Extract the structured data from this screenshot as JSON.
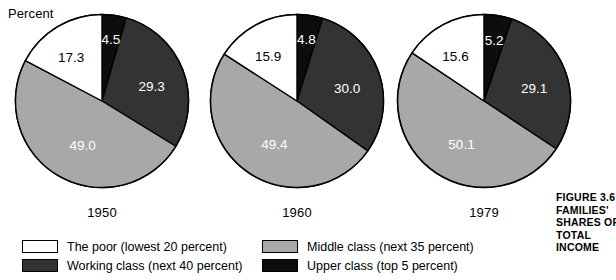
{
  "axis": {
    "unit_label": "Percent"
  },
  "caption": {
    "lines": [
      "FIGURE 3.6",
      "FAMILIES'",
      "SHARES OF",
      "TOTAL",
      "INCOME"
    ]
  },
  "legend": {
    "columns": [
      {
        "items": [
          {
            "label": "The poor (lowest 20 percent)",
            "color": "#ffffff",
            "swatch_name": "legend-swatch-the-poor"
          },
          {
            "label": "Working class (next 40 percent)",
            "color": "#333333",
            "swatch_name": "legend-swatch-working-class"
          }
        ]
      },
      {
        "items": [
          {
            "label": "Middle class (next 35 percent)",
            "color": "#a8a8a8",
            "swatch_name": "legend-swatch-middle-class"
          },
          {
            "label": "Upper class (top 5 percent)",
            "color": "#0d0d0d",
            "swatch_name": "legend-swatch-upper-class"
          }
        ]
      }
    ]
  },
  "colors": {
    "the_poor": "#ffffff",
    "working_class": "#333333",
    "middle_class": "#a8a8a8",
    "upper_class": "#0d0d0d",
    "outline": "#000000",
    "background": "#ffffff"
  },
  "chart_data": {
    "type": "pie",
    "title": "FIGURE 3.6 FAMILIES' SHARES OF TOTAL INCOME",
    "ylabel": "Percent",
    "categories": [
      "Upper class (top 5 percent)",
      "Working class (next 40 percent)",
      "Middle class (next 35 percent)",
      "The poor (lowest 20 percent)"
    ],
    "category_colors": [
      "#0d0d0d",
      "#333333",
      "#a8a8a8",
      "#ffffff"
    ],
    "legend_position": "bottom",
    "charts": [
      {
        "label": "1950",
        "values": [
          4.5,
          29.3,
          49.0,
          17.3
        ],
        "value_labels": [
          "4.5",
          "29.3",
          "49.0",
          "17.3"
        ]
      },
      {
        "label": "1960",
        "values": [
          4.8,
          30.0,
          49.4,
          15.9
        ],
        "value_labels": [
          "4.8",
          "30.0",
          "49.4",
          "15.9"
        ]
      },
      {
        "label": "1979",
        "values": [
          5.2,
          29.1,
          50.1,
          15.6
        ],
        "value_labels": [
          "5.2",
          "29.1",
          "50.1",
          "15.6"
        ]
      }
    ]
  }
}
